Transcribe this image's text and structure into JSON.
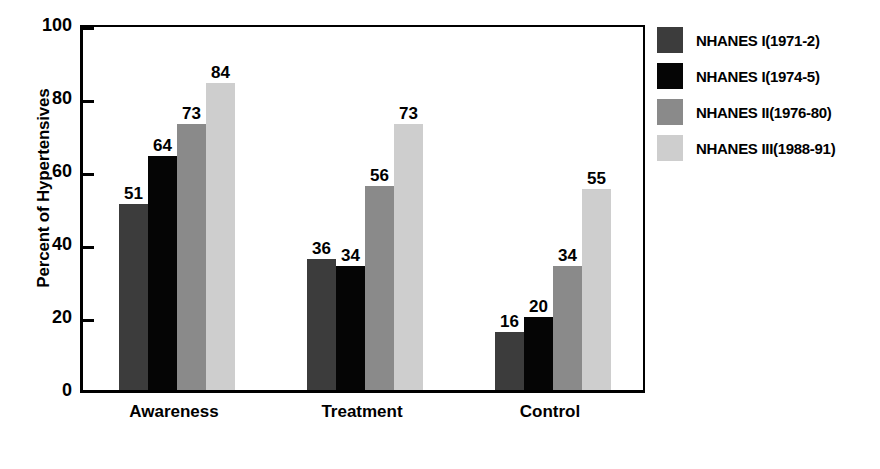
{
  "chart_data": {
    "type": "bar",
    "title": "",
    "xlabel": "",
    "ylabel": "Percent of Hypertensives",
    "categories": [
      "Awareness",
      "Treatment",
      "Control"
    ],
    "ylim": [
      0,
      100
    ],
    "yticks": [
      0,
      20,
      40,
      60,
      80,
      100
    ],
    "grid": false,
    "legend_position": "right",
    "series": [
      {
        "name": "NHANES I(1971-2)",
        "color": "#3c3c3c",
        "values": [
          51,
          36,
          16
        ]
      },
      {
        "name": "NHANES I(1974-5)",
        "color": "#050505",
        "values": [
          64,
          34,
          20
        ]
      },
      {
        "name": "NHANES II(1976-80)",
        "color": "#8a8a8a",
        "values": [
          73,
          56,
          34
        ]
      },
      {
        "name": "NHANES III(1988-91)",
        "color": "#cecece",
        "values": [
          84,
          73,
          55
        ]
      }
    ]
  }
}
